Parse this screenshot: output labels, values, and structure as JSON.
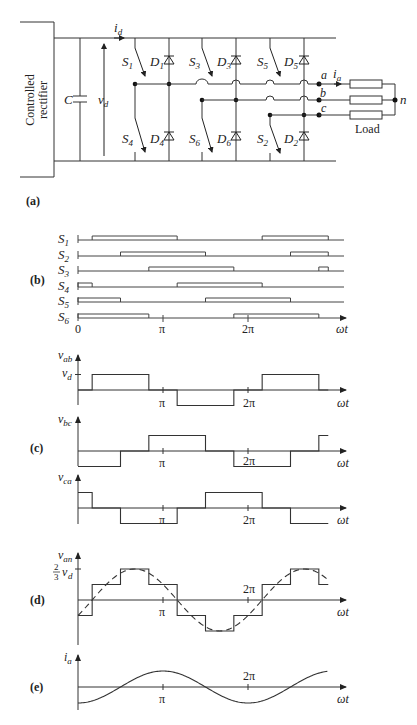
{
  "figure": {
    "panel_labels": [
      "(a)",
      "(b)",
      "(c)",
      "(d)",
      "(e)"
    ],
    "circuit": {
      "source_label_line1": "Controlled",
      "source_label_line2": "rectifier",
      "capacitor": "C",
      "dc_voltage": "v",
      "dc_voltage_sub": "d",
      "dc_current": "i",
      "dc_current_sub": "d",
      "switches": [
        {
          "name": "S",
          "sub": "1"
        },
        {
          "name": "S",
          "sub": "3"
        },
        {
          "name": "S",
          "sub": "5"
        },
        {
          "name": "S",
          "sub": "4"
        },
        {
          "name": "S",
          "sub": "6"
        },
        {
          "name": "S",
          "sub": "2"
        }
      ],
      "diodes": [
        {
          "name": "D",
          "sub": "1"
        },
        {
          "name": "D",
          "sub": "3"
        },
        {
          "name": "D",
          "sub": "5"
        },
        {
          "name": "D",
          "sub": "4"
        },
        {
          "name": "D",
          "sub": "6"
        },
        {
          "name": "D",
          "sub": "2"
        }
      ],
      "phases": [
        "a",
        "b",
        "c"
      ],
      "phase_current": "i",
      "phase_current_sub": "a",
      "neutral": "n",
      "load_label": "Load"
    },
    "axis_labels": {
      "zero": "0",
      "pi": "π",
      "two_pi": "2π",
      "omega_t": "ωt"
    },
    "switch_rows": [
      "S1",
      "S2",
      "S3",
      "S4",
      "S5",
      "S6"
    ],
    "waveforms": {
      "v_ab": {
        "sym": "v",
        "sub": "ab",
        "level": "v",
        "level_sub": "d"
      },
      "v_bc": {
        "sym": "v",
        "sub": "bc"
      },
      "v_ca": {
        "sym": "v",
        "sub": "ca"
      },
      "v_an": {
        "sym": "v",
        "sub": "an",
        "level_num": "2",
        "level_den": "3",
        "level": "v",
        "level_sub": "d"
      },
      "i_a": {
        "sym": "i",
        "sub": "a"
      }
    }
  },
  "chart_data": [
    {
      "type": "line",
      "title": "(b) Gating signals",
      "xlabel": "ωt",
      "x_ticks": [
        "0",
        "π",
        "2π"
      ],
      "xlim_deg": [
        0,
        540
      ],
      "series": [
        {
          "name": "S1",
          "on_intervals_deg": [
            [
              30,
              210
            ],
            [
              390,
              530
            ]
          ]
        },
        {
          "name": "S2",
          "on_intervals_deg": [
            [
              90,
              270
            ],
            [
              450,
              530
            ]
          ]
        },
        {
          "name": "S3",
          "on_intervals_deg": [
            [
              150,
              330
            ],
            [
              510,
              530
            ]
          ]
        },
        {
          "name": "S4",
          "on_intervals_deg": [
            [
              0,
              30
            ],
            [
              210,
              390
            ]
          ]
        },
        {
          "name": "S5",
          "on_intervals_deg": [
            [
              0,
              90
            ],
            [
              270,
              450
            ]
          ]
        },
        {
          "name": "S6",
          "on_intervals_deg": [
            [
              0,
              150
            ],
            [
              330,
              510
            ]
          ]
        }
      ]
    },
    {
      "type": "line",
      "title": "(c) Line-to-line voltages",
      "xlabel": "ωt",
      "x_ticks": [
        "π",
        "2π"
      ],
      "y_levels": [
        "v_d",
        "0",
        "-v_d"
      ],
      "series": [
        {
          "name": "v_ab",
          "steps_deg": [
            [
              0,
              30,
              0
            ],
            [
              30,
              150,
              1
            ],
            [
              150,
              210,
              0
            ],
            [
              210,
              330,
              -1
            ],
            [
              330,
              390,
              0
            ],
            [
              390,
              510,
              1
            ],
            [
              510,
              530,
              0
            ]
          ]
        },
        {
          "name": "v_bc",
          "steps_deg": [
            [
              0,
              90,
              -1
            ],
            [
              90,
              150,
              0
            ],
            [
              150,
              270,
              1
            ],
            [
              270,
              330,
              0
            ],
            [
              330,
              450,
              -1
            ],
            [
              450,
              510,
              0
            ],
            [
              510,
              530,
              1
            ]
          ]
        },
        {
          "name": "v_ca",
          "steps_deg": [
            [
              0,
              30,
              1
            ],
            [
              30,
              90,
              0
            ],
            [
              90,
              210,
              -1
            ],
            [
              210,
              270,
              0
            ],
            [
              270,
              390,
              1
            ],
            [
              390,
              450,
              0
            ],
            [
              450,
              530,
              -1
            ]
          ]
        }
      ]
    },
    {
      "type": "line",
      "title": "(d) Phase voltage v_an (six-step) with fundamental (dashed)",
      "xlabel": "ωt",
      "x_ticks": [
        "π",
        "2π"
      ],
      "y_levels": [
        "2/3 v_d",
        "1/3 v_d",
        "0",
        "-1/3 v_d",
        "-2/3 v_d"
      ],
      "series": [
        {
          "name": "v_an step (units of v_d/3)",
          "steps_deg": [
            [
              0,
              30,
              -1
            ],
            [
              30,
              90,
              1
            ],
            [
              90,
              150,
              2
            ],
            [
              150,
              210,
              1
            ],
            [
              210,
              270,
              -1
            ],
            [
              270,
              330,
              -2
            ],
            [
              330,
              390,
              -1
            ],
            [
              390,
              450,
              1
            ],
            [
              450,
              510,
              2
            ],
            [
              510,
              530,
              1
            ]
          ]
        },
        {
          "name": "fundamental",
          "shape": "sin(ωt - 30°)",
          "style": "dashed"
        }
      ]
    },
    {
      "type": "line",
      "title": "(e) Phase current i_a",
      "xlabel": "ωt",
      "x_ticks": [
        "π",
        "2π"
      ],
      "series": [
        {
          "name": "i_a",
          "shape": "-cos(ωt)",
          "zero_crossings_deg": [
            90,
            270,
            450
          ],
          "max_deg": 180,
          "min_deg": 360
        }
      ]
    }
  ]
}
